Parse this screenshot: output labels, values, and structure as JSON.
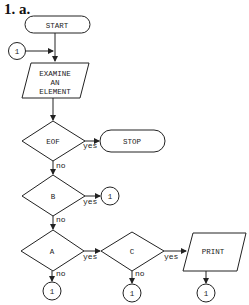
{
  "title": "1. a.",
  "nodes": {
    "start": "START",
    "examine": [
      "EXAMINE",
      "AN",
      "ELEMENT"
    ],
    "eof": "EOF",
    "stop": "STOP",
    "b": "B",
    "a": "A",
    "c": "C",
    "print": "PRINT",
    "connector": "1"
  },
  "edges": {
    "yes": "yes",
    "no": "no"
  },
  "colors": {
    "stroke": "#222222",
    "background": "#ffffff"
  }
}
